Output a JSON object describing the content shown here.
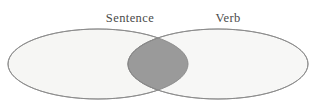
{
  "figure": {
    "type": "venn-diagram",
    "set_count": 2,
    "background_color": "#ffffff"
  },
  "labels": {
    "left": "Sentence",
    "right": "Verb"
  },
  "colors": {
    "ellipse_fill": "#f6f6f4",
    "ellipse_stroke": "#8a8a8a",
    "intersection_fill": "#9a9a9a",
    "intersection_stroke": "#7d7d7d",
    "label_color": "#4a4a4a"
  },
  "chart_data": {
    "type": "venn",
    "title": "",
    "sets": [
      {
        "name": "Sentence",
        "label_x": 130,
        "label_y": 22,
        "ellipse": {
          "cx": 98,
          "cy": 64,
          "rx": 90,
          "ry": 35
        }
      },
      {
        "name": "Verb",
        "label_x": 228,
        "label_y": 22,
        "ellipse": {
          "cx": 218,
          "cy": 64,
          "rx": 90,
          "ry": 35
        }
      }
    ],
    "intersection": {
      "label": "",
      "shaded": true,
      "left_x": 152,
      "right_x": 222,
      "top_crossing": {
        "x": 187,
        "y": 30
      },
      "bottom_crossing": {
        "x": 187,
        "y": 98
      }
    },
    "legend": null,
    "grid": false
  }
}
